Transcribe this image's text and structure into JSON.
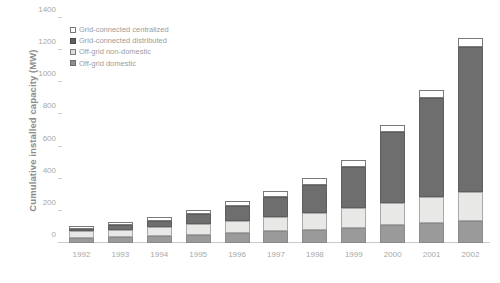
{
  "chart_data": {
    "type": "bar",
    "subtype": "stacked-vertical",
    "title": "",
    "xlabel": "",
    "ylabel": "Cumulative installed capacity (MW)",
    "ylim": [
      0,
      1400
    ],
    "yticks": [
      0,
      200,
      400,
      600,
      800,
      1000,
      1200,
      1400
    ],
    "grid": false,
    "legend_position": "top-left",
    "categories": [
      "1992",
      "1993",
      "1994",
      "1995",
      "1996",
      "1997",
      "1998",
      "1999",
      "2000",
      "2001",
      "2002"
    ],
    "series": [
      {
        "name": "Off-grid domestic",
        "color": "#9a9a9a",
        "values": [
          30,
          36,
          44,
          52,
          62,
          72,
          84,
          96,
          110,
          124,
          140
        ]
      },
      {
        "name": "Off-grid non-domestic",
        "color": "#e8e8e6",
        "values": [
          42,
          48,
          56,
          66,
          78,
          90,
          104,
          120,
          140,
          160,
          180
        ]
      },
      {
        "name": "Grid-connected distributed",
        "color": "#6e6e6e",
        "values": [
          18,
          26,
          38,
          62,
          92,
          126,
          176,
          256,
          440,
          620,
          900
        ]
      },
      {
        "name": "Grid-connected centralized",
        "color": "#ffffff",
        "values": [
          14,
          18,
          22,
          26,
          30,
          34,
          38,
          42,
          46,
          50,
          54
        ]
      }
    ],
    "totals": [
      104,
      128,
      160,
      206,
      262,
      322,
      402,
      514,
      736,
      954,
      1274
    ]
  },
  "legend": {
    "items": [
      {
        "label": "Grid-connected centralized",
        "swatch": "s3"
      },
      {
        "label": "Grid-connected distributed",
        "swatch": "s2"
      },
      {
        "label": "Off-grid non-domestic",
        "swatch": "s1"
      },
      {
        "label": "Off-grid domestic",
        "swatch": "s0"
      }
    ]
  }
}
